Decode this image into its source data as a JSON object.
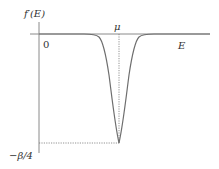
{
  "diagram": {
    "type": "function-plot",
    "y_axis_label": "f′(E)",
    "x_axis_label": "E",
    "origin_label": "0",
    "mu_label": "μ",
    "min_label": "−β/4",
    "colors": {
      "axis": "#8a8a8a",
      "curve": "#6e6e6e",
      "guide": "#777777",
      "text": "#333333"
    }
  }
}
